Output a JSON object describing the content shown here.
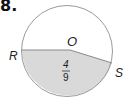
{
  "problem": {
    "number": "8."
  },
  "diagram": {
    "center_label": "O",
    "point_labels": {
      "left": "R",
      "right": "S"
    },
    "sector_fraction": {
      "numerator": "4",
      "denominator": "9"
    },
    "colors": {
      "stroke": "#9a9a9a",
      "shade": "#d9d9d9",
      "background": "#ffffff"
    }
  }
}
